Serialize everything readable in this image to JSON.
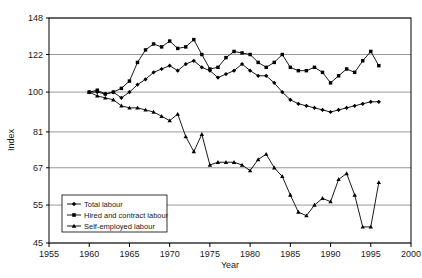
{
  "chart_data": {
    "type": "line",
    "title": "",
    "xlabel": "Year",
    "ylabel": "Index",
    "yscale": "log",
    "ylim": [
      45,
      148
    ],
    "xlim": [
      1955,
      2000
    ],
    "grid": true,
    "legend_position": "bottom-left",
    "ytick_labels": [
      "148",
      "122",
      "100",
      "81",
      "67",
      "55",
      "45"
    ],
    "yticks": [
      148,
      122,
      100,
      81,
      67,
      55,
      45
    ],
    "xtick_labels": [
      "1955",
      "1960",
      "1965",
      "1970",
      "1975",
      "1980",
      "1985",
      "1990",
      "1995",
      "2000"
    ],
    "xticks": [
      1955,
      1960,
      1965,
      1970,
      1975,
      1980,
      1985,
      1990,
      1995,
      2000
    ],
    "x": [
      1960,
      1961,
      1962,
      1963,
      1964,
      1965,
      1966,
      1967,
      1968,
      1969,
      1970,
      1971,
      1972,
      1973,
      1974,
      1975,
      1976,
      1977,
      1978,
      1979,
      1980,
      1981,
      1982,
      1983,
      1984,
      1985,
      1986,
      1987,
      1988,
      1989,
      1990,
      1991,
      1992,
      1993,
      1994,
      1995,
      1996
    ],
    "series": [
      {
        "name": "Total labour",
        "marker": "diamond",
        "color": "#000000",
        "values": [
          100,
          100,
          99,
          100,
          97,
          100,
          104,
          107,
          111,
          113,
          115,
          112,
          116,
          118,
          114,
          112,
          108,
          110,
          112,
          116,
          112,
          109,
          109,
          105,
          100,
          96,
          94,
          93,
          92,
          91,
          90,
          91,
          92,
          93,
          94,
          95,
          95
        ]
      },
      {
        "name": "Hired and contract labour",
        "marker": "square",
        "color": "#000000",
        "values": [
          100,
          101,
          99,
          100,
          102,
          106,
          117,
          125,
          129,
          127,
          131,
          126,
          127,
          132,
          122,
          113,
          114,
          120,
          124,
          123,
          122,
          117,
          114,
          117,
          122,
          114,
          112,
          112,
          114,
          111,
          105,
          109,
          113,
          111,
          118,
          124,
          115
        ]
      },
      {
        "name": "Self-employed labour",
        "marker": "triangle",
        "color": "#000000",
        "values": [
          100,
          98,
          97,
          96,
          93,
          92,
          92,
          91,
          90,
          88,
          86,
          89,
          79,
          73,
          80,
          68,
          69,
          69,
          69,
          68,
          66,
          70,
          72,
          67,
          64,
          58,
          53,
          52,
          55,
          57,
          56,
          63,
          65,
          58,
          49,
          49,
          62
        ]
      }
    ]
  },
  "legend": {
    "items": [
      {
        "label": "Total labour",
        "marker": "diamond"
      },
      {
        "label": "Hired and contract labour",
        "marker": "square"
      },
      {
        "label": "Self-employed labour",
        "marker": "triangle"
      }
    ]
  },
  "caption": {
    "text": ""
  }
}
